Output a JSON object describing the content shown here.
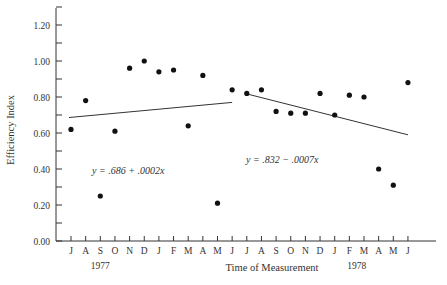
{
  "chart_data": {
    "type": "scatter",
    "title": "",
    "xlabel": "Time of Measurement",
    "ylabel": "Efficiency Index",
    "ylim": [
      0.0,
      1.3
    ],
    "yticks": [
      "0.00",
      "0.20",
      "0.40",
      "0.60",
      "0.80",
      "1.00",
      "1.20"
    ],
    "x_tick_labels": [
      "J",
      "A",
      "S",
      "O",
      "N",
      "D",
      "J",
      "F",
      "M",
      "A",
      "M",
      "J",
      "J",
      "A",
      "S",
      "O",
      "N",
      "D",
      "J",
      "F",
      "M",
      "A",
      "M",
      "J"
    ],
    "year_labels": [
      {
        "label": "1977",
        "under_index": 2
      },
      {
        "label": "1978",
        "under_index": 19.5
      }
    ],
    "grid": false,
    "series": [
      {
        "name": "Period 1",
        "x": [
          "J",
          "A",
          "S",
          "O",
          "N",
          "D",
          "J",
          "F",
          "M",
          "A",
          "M",
          "J"
        ],
        "values": [
          0.62,
          0.78,
          0.25,
          0.61,
          0.96,
          1.0,
          0.94,
          0.95,
          0.64,
          0.92,
          0.21,
          0.84
        ]
      },
      {
        "name": "Period 2",
        "x": [
          "J",
          "A",
          "S",
          "O",
          "N",
          "D",
          "J",
          "F",
          "M",
          "A",
          "M",
          "J"
        ],
        "values": [
          0.82,
          0.84,
          0.72,
          0.71,
          0.71,
          0.82,
          0.7,
          0.81,
          0.8,
          0.4,
          0.31,
          0.88
        ]
      }
    ],
    "regression_lines": [
      {
        "label": "y = .686 + .0002x",
        "start_index": 0,
        "end_index": 11,
        "y_start": 0.686,
        "y_end": 0.77
      },
      {
        "label": "y = .832 − .0007x",
        "start_index": 12,
        "end_index": 23,
        "y_start": 0.82,
        "y_end": 0.59
      }
    ]
  }
}
